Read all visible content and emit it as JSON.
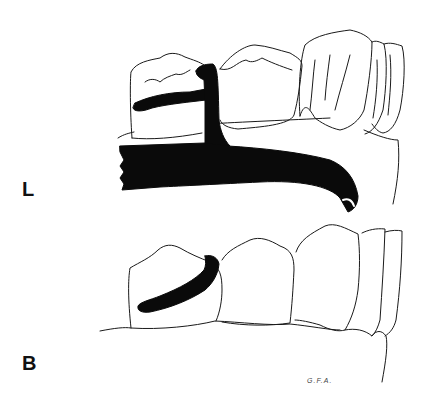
{
  "figure": {
    "views": [
      {
        "id": "lingual",
        "label": "L"
      },
      {
        "id": "buccal",
        "label": "B"
      }
    ],
    "signature": "G.F.A.",
    "colors": {
      "line": "#1a1a1a",
      "fill": "#0a0a0a",
      "background": "#ffffff"
    }
  }
}
